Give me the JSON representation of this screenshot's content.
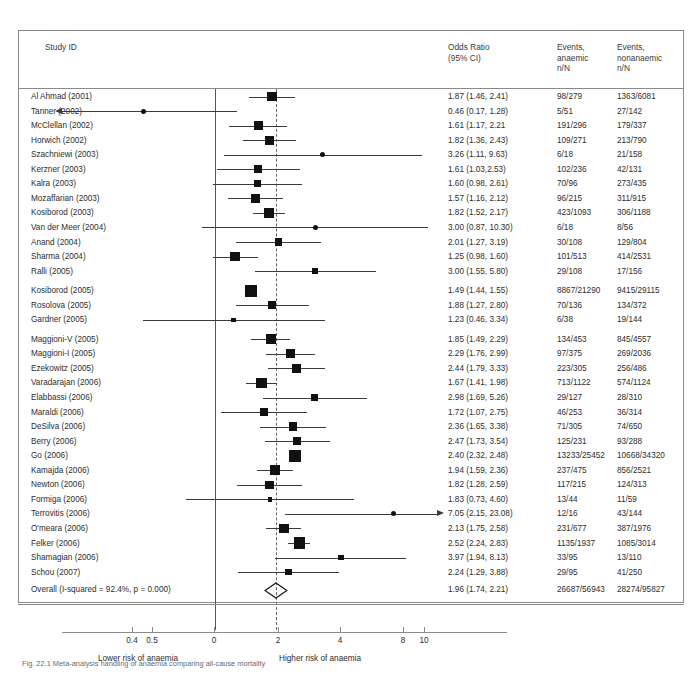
{
  "header": {
    "study_id": "Study ID",
    "odds_ratio": "Odds Ratio\n(95% CI)",
    "events_anaemic": "Events,\nanaemic\nn/N",
    "events_nonanaemic": "Events,\nnonanaemic\nn/N"
  },
  "axis": {
    "ticks": [
      {
        "label": "0.4",
        "x": 132
      },
      {
        "label": "0.5",
        "x": 152
      },
      {
        "label": "0",
        "x": 214
      },
      {
        "label": "2",
        "x": 278
      },
      {
        "label": "4",
        "x": 340
      },
      {
        "label": "8",
        "x": 403
      },
      {
        "label": "10",
        "x": 424
      }
    ],
    "left_caption": "Lower risk of anaemia",
    "right_caption": "Higher risk of anaemia"
  },
  "caption": "Fig. 22.1  Meta-analysis handling of anaemia comparing all-cause mortality",
  "colors": {
    "marker": "#111111",
    "line": "#3b3b3b",
    "rule": "#8a8a8a",
    "text": "#2d2d2d"
  },
  "chart_data": {
    "type": "forest",
    "xlabel": "Odds Ratio (95% CI)",
    "ylabel": "Study ID",
    "xscale": "log",
    "xlim": [
      0.15,
      25
    ],
    "null_value": 1,
    "pooled_value": 1.96,
    "grid": false,
    "columns": [
      "Study ID",
      "Odds Ratio (95% CI)",
      "Events, anaemic n/N",
      "Events, nonanaemic n/N"
    ],
    "rows": [
      {
        "study": "Al Ahmad (2001)",
        "or": 1.87,
        "lo": 1.46,
        "hi": 2.41,
        "or_text": "1.87 (1.46, 2.41)",
        "anaemic": "98/279",
        "nonanaemic": "1363/6081",
        "weight": 3.2
      },
      {
        "study": "Tanner (2002)",
        "or": 0.46,
        "lo": 0.17,
        "hi": 1.28,
        "or_text": "0.46 (0.17, 1.28)",
        "anaemic": "5/51",
        "nonanaemic": "27/142",
        "weight": 0.8
      },
      {
        "study": "McClellan (2002)",
        "or": 1.61,
        "lo": 1.17,
        "hi": 2.21,
        "or_text": "1.61 (1.17, 2.21",
        "anaemic": "191/296",
        "nonanaemic": "179/337",
        "weight": 2.8
      },
      {
        "study": "Horwich (2002)",
        "or": 1.82,
        "lo": 1.36,
        "hi": 2.43,
        "or_text": "1.82 (1.36, 2.43)",
        "anaemic": "109/271",
        "nonanaemic": "213/790",
        "weight": 2.9
      },
      {
        "study": "Szachniewi (2003)",
        "or": 3.26,
        "lo": 1.11,
        "hi": 9.63,
        "or_text": "3.26 (1.11, 9.63)",
        "anaemic": "6/18",
        "nonanaemic": "21/158",
        "weight": 0.8
      },
      {
        "study": "Kerzner (2003)",
        "or": 1.61,
        "lo": 1.03,
        "hi": 2.53,
        "or_text": "1.61 (1.03,2.53)",
        "anaemic": "102/236",
        "nonanaemic": "42/131",
        "weight": 2.4
      },
      {
        "study": "Kalra (2003)",
        "or": 1.6,
        "lo": 0.98,
        "hi": 2.61,
        "or_text": "1.60 (0.98, 2.61)",
        "anaemic": "70/96",
        "nonanaemic": "273/435",
        "weight": 2.2
      },
      {
        "study": "Mozaffarian (2003)",
        "or": 1.57,
        "lo": 1.16,
        "hi": 2.12,
        "or_text": "1.57 (1.16, 2.12)",
        "anaemic": "96/215",
        "nonanaemic": "311/915",
        "weight": 2.8
      },
      {
        "study": "Kosiborod (2003)",
        "or": 1.82,
        "lo": 1.52,
        "hi": 2.17,
        "or_text": "1.82 (1.52, 2.17)",
        "anaemic": "423/1093",
        "nonanaemic": "306/1188",
        "weight": 3.4
      },
      {
        "study": "Van der Meer (2004)",
        "or": 3.0,
        "lo": 0.87,
        "hi": 10.3,
        "or_text": "3.00 (0.87, 10.30)",
        "anaemic": "6/18",
        "nonanaemic": "8/56",
        "weight": 0.9
      },
      {
        "study": "Anand (2004)",
        "or": 2.01,
        "lo": 1.27,
        "hi": 3.19,
        "or_text": "2.01 (1.27, 3.19)",
        "anaemic": "30/108",
        "nonanaemic": "129/804",
        "weight": 2.2
      },
      {
        "study": "Sharma (2004)",
        "or": 1.25,
        "lo": 0.98,
        "hi": 1.6,
        "or_text": "1.25 (0.98, 1.60)",
        "anaemic": "101/513",
        "nonanaemic": "414/2531",
        "weight": 3.1
      },
      {
        "study": "Ralli (2005)",
        "or": 3.0,
        "lo": 1.55,
        "hi": 5.8,
        "or_text": "3.00 (1.55, 5.80)",
        "anaemic": "29/108",
        "nonanaemic": "17/156",
        "weight": 1.6
      },
      {
        "study": "Kosiborod (2005)",
        "or": 1.49,
        "lo": 1.44,
        "hi": 1.55,
        "or_text": "1.49 (1.44, 1.55)",
        "anaemic": "8867/21290",
        "nonanaemic": "9415/29115",
        "weight": 4.2
      },
      {
        "study": "Rosolova (2005)",
        "or": 1.88,
        "lo": 1.27,
        "hi": 2.8,
        "or_text": "1.88 (1.27, 2.80)",
        "anaemic": "70/136",
        "nonanaemic": "134/372",
        "weight": 2.4
      },
      {
        "study": "Gardner (2005)",
        "or": 1.23,
        "lo": 0.46,
        "hi": 3.34,
        "or_text": "1.23 (0.46, 3.34)",
        "anaemic": "6/38",
        "nonanaemic": "19/144",
        "weight": 0.9
      },
      {
        "study": "Maggioni-V (2005)",
        "or": 1.85,
        "lo": 1.49,
        "hi": 2.29,
        "or_text": "1.85 (1.49, 2.29)",
        "anaemic": "134/453",
        "nonanaemic": "845/4557",
        "weight": 3.2
      },
      {
        "study": "Maggioni-I (2005)",
        "or": 2.29,
        "lo": 1.76,
        "hi": 2.99,
        "or_text": "2.29 (1.76, 2.99)",
        "anaemic": "97/375",
        "nonanaemic": "269/2036",
        "weight": 3.0
      },
      {
        "study": "Ezekowitz (2005)",
        "or": 2.44,
        "lo": 1.79,
        "hi": 3.33,
        "or_text": "2.44 (1.79, 3.33)",
        "anaemic": "223/305",
        "nonanaemic": "256/486",
        "weight": 2.8
      },
      {
        "study": "Varadarajan (2006)",
        "or": 1.67,
        "lo": 1.41,
        "hi": 1.98,
        "or_text": "1.67 (1.41, 1.98)",
        "anaemic": "713/1122",
        "nonanaemic": "574/1124",
        "weight": 3.5
      },
      {
        "study": "Elabbassi (2006)",
        "or": 2.98,
        "lo": 1.69,
        "hi": 5.26,
        "or_text": "2.98 (1.69, 5.26)",
        "anaemic": "29/127",
        "nonanaemic": "28/310",
        "weight": 1.8
      },
      {
        "study": "Maraldi (2006)",
        "or": 1.72,
        "lo": 1.07,
        "hi": 2.75,
        "or_text": "1.72 (1.07, 2.75)",
        "anaemic": "46/253",
        "nonanaemic": "36/314",
        "weight": 2.2
      },
      {
        "study": "DeSilva (2006)",
        "or": 2.36,
        "lo": 1.65,
        "hi": 3.38,
        "or_text": "2.36 (1.65, 3.38)",
        "anaemic": "71/305",
        "nonanaemic": "74/650",
        "weight": 2.6
      },
      {
        "study": "Berry (2006)",
        "or": 2.47,
        "lo": 1.73,
        "hi": 3.54,
        "or_text": "2.47 (1.73, 3.54)",
        "anaemic": "125/231",
        "nonanaemic": "93/288",
        "weight": 2.6
      },
      {
        "study": "Go (2006)",
        "or": 2.4,
        "lo": 2.32,
        "hi": 2.48,
        "or_text": "2.40 (2.32, 2.48)",
        "anaemic": "13233/25452",
        "nonanaemic": "10668/34320",
        "weight": 4.3
      },
      {
        "study": "Kamajda (2006)",
        "or": 1.94,
        "lo": 1.59,
        "hi": 2.36,
        "or_text": "1.94 (1.59, 2.36)",
        "anaemic": "237/475",
        "nonanaemic": "856/2521",
        "weight": 3.2
      },
      {
        "study": "Newton (2006)",
        "or": 1.82,
        "lo": 1.28,
        "hi": 2.59,
        "or_text": "1.82 (1.28, 2.59)",
        "anaemic": "117/215",
        "nonanaemic": "124/313",
        "weight": 2.6
      },
      {
        "study": "Formiga (2006)",
        "or": 1.83,
        "lo": 0.73,
        "hi": 4.6,
        "or_text": "1.83 (0.73, 4.60)",
        "anaemic": "13/44",
        "nonanaemic": "11/59",
        "weight": 1.0
      },
      {
        "study": "Terrovitis (2006)",
        "or": 7.05,
        "lo": 2.15,
        "hi": 23.08,
        "or_text": "7.05 (2.15, 23.08)",
        "anaemic": "12/16",
        "nonanaemic": "43/144",
        "weight": 0.9
      },
      {
        "study": "O'meara (2006)",
        "or": 2.13,
        "lo": 1.75,
        "hi": 2.58,
        "or_text": "2.13 (1.75, 2.58)",
        "anaemic": "231/677",
        "nonanaemic": "387/1976",
        "weight": 3.2
      },
      {
        "study": "Felker (2006)",
        "or": 2.52,
        "lo": 2.24,
        "hi": 2.83,
        "or_text": "2.52 (2.24, 2.83)",
        "anaemic": "1135/1937",
        "nonanaemic": "1085/3014",
        "weight": 3.8
      },
      {
        "study": "Shamagian (2006)",
        "or": 3.97,
        "lo": 1.94,
        "hi": 8.13,
        "or_text": "3.97 (1.94, 8.13)",
        "anaemic": "33/95",
        "nonanaemic": "13/110",
        "weight": 1.4
      },
      {
        "study": "Schou (2007)",
        "or": 2.24,
        "lo": 1.29,
        "hi": 3.88,
        "or_text": "2.24 (1.29, 3.88)",
        "anaemic": "29/95",
        "nonanaemic": "41/250",
        "weight": 1.9
      }
    ],
    "overall": {
      "study": "Overall (I-squared = 92.4%, p = 0.000)",
      "or": 1.96,
      "lo": 1.74,
      "hi": 2.21,
      "or_text": "1.96 (1.74, 2.21)",
      "anaemic": "26687/56943",
      "nonanaemic": "28274/95827"
    }
  }
}
